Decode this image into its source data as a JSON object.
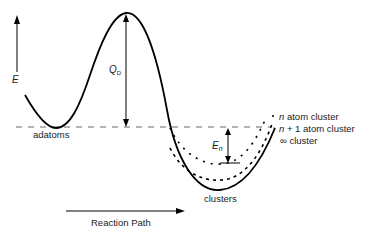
{
  "diagram": {
    "type": "energy-landscape",
    "y_axis_label": "E",
    "x_axis_label": "Reaction Path",
    "barrier_label": {
      "symbol": "Q",
      "subscript": "D"
    },
    "binding_label": {
      "symbol": "E",
      "subscript": "n"
    },
    "minima": {
      "left": "adatoms",
      "right": "clusters"
    },
    "legend": [
      {
        "prefix": "n",
        "text": " atom cluster",
        "style": "sparse-dotted"
      },
      {
        "prefix": "n",
        "text": " + 1 atom cluster",
        "style": "dashed"
      },
      {
        "prefix": "∞",
        "text": " cluster",
        "style": "solid"
      }
    ],
    "colors": {
      "line": "#000000",
      "reference": "#555555",
      "text": "#222222"
    }
  }
}
